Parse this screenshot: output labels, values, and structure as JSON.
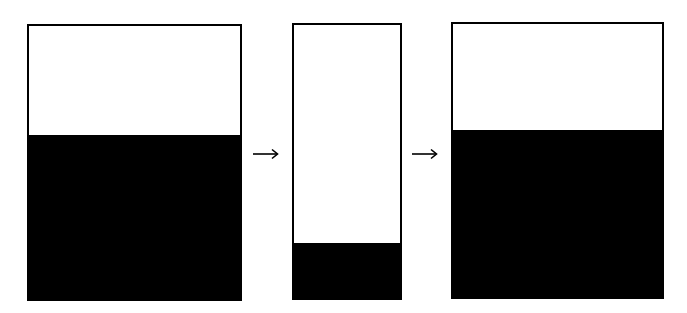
{
  "colors": {
    "fill": "#000000",
    "empty": "#ffffff",
    "stroke": "#000000"
  },
  "containers": [
    {
      "id": "left",
      "fill_fraction": 0.6
    },
    {
      "id": "middle",
      "fill_fraction": 0.2
    },
    {
      "id": "right",
      "fill_fraction": 0.61
    }
  ],
  "arrows": [
    {
      "id": "arrow-1",
      "icon": "right-arrow-icon"
    },
    {
      "id": "arrow-2",
      "icon": "right-arrow-icon"
    }
  ]
}
